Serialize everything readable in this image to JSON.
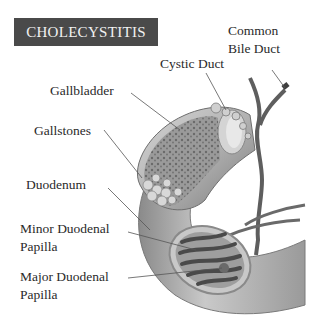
{
  "title": "CHOLECYSTITIS",
  "labels": {
    "common_bile_duct_line1": "Common",
    "common_bile_duct_line2": "Bile Duct",
    "cystic_duct": "Cystic Duct",
    "gallbladder": "Gallbladder",
    "gallstones": "Gallstones",
    "duodenum": "Duodenum",
    "minor_papilla_line1": "Minor Duodenal",
    "minor_papilla_line2": "Papilla",
    "major_papilla_line1": "Major Duodenal",
    "major_papilla_line2": "Papilla"
  },
  "colors": {
    "title_bg": "#4a4a4a",
    "title_text": "#f2f2f2",
    "label_text": "#2a2a2a",
    "tissue": "#a9a9a9",
    "duct": "#5e5e5e"
  }
}
